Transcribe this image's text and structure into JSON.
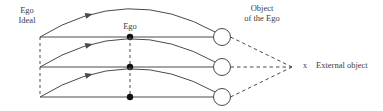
{
  "figure": {
    "type": "diagram",
    "background_color": "#ffffff",
    "line_color": "#4a4a4a",
    "text_color": "#3c3c3c",
    "width": 383,
    "height": 111
  },
  "labels": {
    "ego_ideal": "Ego\nIdeal",
    "ego": "Ego",
    "object_of_the_ego": "Object\nof the Ego",
    "external_object": "External object",
    "x_marker": "x"
  },
  "rows": [
    {
      "name": "row-top",
      "baseline_y": 37
    },
    {
      "name": "row-middle",
      "baseline_y": 67
    },
    {
      "name": "row-bottom",
      "baseline_y": 97
    }
  ],
  "geometry": {
    "baseline_x_start": 40,
    "baseline_x_end": 214,
    "ego_dot_x": 130,
    "ego_dot_radius": 3.2,
    "circle_cx": 222,
    "circle_r": 8.5,
    "convergence_x": 296,
    "convergence_y": 67,
    "arc_peak_offset": 27,
    "arrow_t": 0.3
  }
}
